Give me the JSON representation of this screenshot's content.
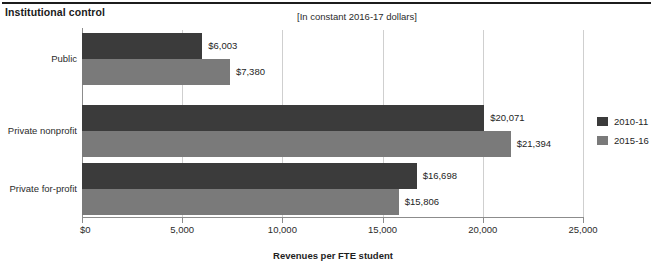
{
  "chart_data": {
    "type": "bar",
    "orientation": "horizontal",
    "title": "Institutional control",
    "subtitle": "[In constant 2016-17 dollars]",
    "xlabel": "Revenues per FTE student",
    "ylabel": "",
    "categories": [
      "Public",
      "Private nonprofit",
      "Private for-profit"
    ],
    "series": [
      {
        "name": "2010-11",
        "color": "#3b3b3b",
        "values": [
          6003,
          20071,
          16698
        ],
        "labels": [
          "$6,003",
          "$20,071",
          "$16,698"
        ]
      },
      {
        "name": "2015-16",
        "color": "#7a7a7a",
        "values": [
          7380,
          21394,
          15806
        ],
        "labels": [
          "$7,380",
          "$21,394",
          "$15,806"
        ]
      }
    ],
    "xlim": [
      0,
      25000
    ],
    "xticks": [
      0,
      5000,
      10000,
      15000,
      20000,
      25000
    ],
    "xtick_labels": [
      "$0",
      "5,000",
      "10,000",
      "15,000",
      "20,000",
      "25,000"
    ],
    "grid": true,
    "legend_position": "right"
  },
  "legend": {
    "items": [
      {
        "label": "2010-11"
      },
      {
        "label": "2015-16"
      }
    ]
  }
}
